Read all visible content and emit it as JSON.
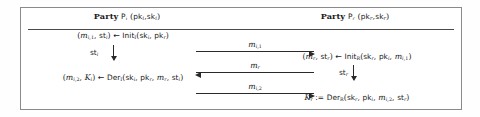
{
  "diagram": {
    "type": "protocol-flow",
    "headers": {
      "left": "Party Pᵢ (pkᵢ, skᵢ)",
      "right": "Party Pᵣ (pkᵣ, skᵣ)",
      "left_party_word": "Party",
      "right_party_word": "Party"
    },
    "left_column": {
      "line1": "(mᵢ,₁, stᵢ) ← Initᴵ(skᵢ, pkᵣ)",
      "state_label": "stᵢ",
      "line2": "(mᵢ,₂, Kᵢ) ← Derᴵ(skᵢ, pkᵣ, mᵣ, stᵢ)"
    },
    "right_column": {
      "line1": "(mᵣ, stᵣ) ← Initᴿ(skᵣ, pkᵢ, mᵢ,₁)",
      "state_label": "stᵣ",
      "line2": "Kᵣ := Derᴿ(skᵣ, pkᵢ, mᵢ,₂, stᵣ)"
    },
    "messages": [
      {
        "label": "mᵢ,₁",
        "direction": "right"
      },
      {
        "label": "mᵣ",
        "direction": "left"
      },
      {
        "label": "mᵢ,₂",
        "direction": "right"
      }
    ],
    "symbols": {
      "assign_arrow": "←",
      "define": ":=",
      "down_arrow": "↓"
    },
    "colors": {
      "frame_border": "#8a8a8a",
      "rule": "#4a4a4a",
      "arrow": "#2a2a2a",
      "text": "#1a1a1a",
      "background": "#ffffff"
    }
  }
}
